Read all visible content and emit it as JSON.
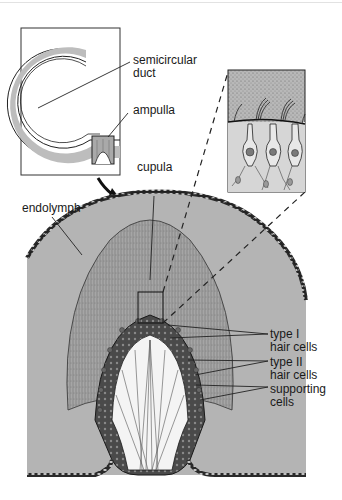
{
  "figure": {
    "labels": {
      "semicircular_duct": [
        "semicircular",
        "duct"
      ],
      "ampulla": "ampulla",
      "cupula": "cupula",
      "endolymph": "endolymph",
      "type_I_hair_cells": [
        "type I",
        "hair cells"
      ],
      "type_II_hair_cells": [
        "type II",
        "hair cells"
      ],
      "supporting_cells": [
        "supporting",
        "cells"
      ]
    },
    "insets": {
      "overview": "semicircular duct with ampulla (boxed)",
      "magnified": "detail of hair cells with stereocilia in cupula"
    },
    "colors": {
      "endolymph_fill": "#b4b4b4",
      "cupula_fill": "#a8a8a8",
      "epithelium_dark": "#3a3a3a",
      "line": "#1a1a1a",
      "background": "#ffffff"
    }
  }
}
